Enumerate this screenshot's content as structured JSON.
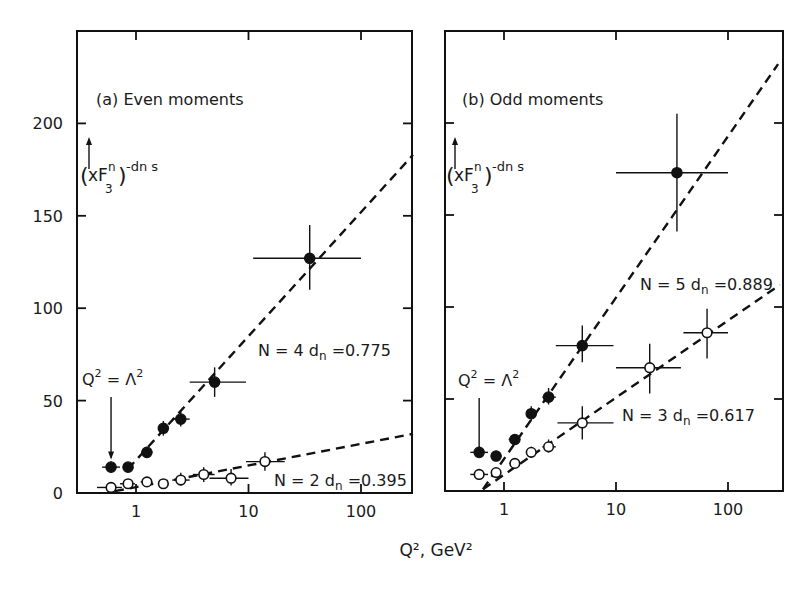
{
  "figure": {
    "xlabel": "Q², GeV²",
    "scale": {
      "x": "log",
      "y": "linear"
    }
  },
  "chart_data": [
    {
      "type": "scatter",
      "panel": "a",
      "title": "(a) Even moments",
      "ylabel": "(xF₃ⁿ)^(−dₙ s)",
      "ylabel_parts": {
        "open": "(",
        "base": "xF",
        "sub": "3",
        "sup": "n",
        "close": ")",
        "exp": "-dn s"
      },
      "xlabel": "Q², GeV²",
      "xscale": "log",
      "xlim": [
        0.3,
        290
      ],
      "ylim": [
        0,
        240
      ],
      "xticks": [
        1,
        10,
        100
      ],
      "xtick_labels": [
        "1",
        "10",
        "100"
      ],
      "yticks": [
        0,
        50,
        100,
        150,
        200
      ],
      "ytick_labels": [
        "0",
        "50",
        "100",
        "150",
        "200"
      ],
      "annotation": {
        "text_left": "Q",
        "sup1": "2",
        "eq": " = Λ",
        "sup2": "2",
        "arrow_x": 0.6
      },
      "series": [
        {
          "name": "N = 4",
          "label": "N = 4",
          "dn_label": "dn",
          "dn_value": "=0.775",
          "marker": "filled",
          "points": [
            {
              "x": 0.6,
              "y": 14,
              "xerr": [
                0.5,
                0.72
              ],
              "yerr": [
                11,
                17
              ]
            },
            {
              "x": 0.85,
              "y": 14,
              "xerr": [
                0.78,
                0.92
              ],
              "yerr": [
                12,
                16
              ]
            },
            {
              "x": 1.25,
              "y": 22,
              "xerr": [
                1.12,
                1.4
              ],
              "yerr": [
                19,
                25
              ]
            },
            {
              "x": 1.75,
              "y": 35,
              "xerr": [
                1.6,
                1.95
              ],
              "yerr": [
                31,
                39
              ]
            },
            {
              "x": 2.5,
              "y": 40,
              "xerr": [
                2.1,
                3.0
              ],
              "yerr": [
                36,
                44
              ]
            },
            {
              "x": 5,
              "y": 60,
              "xerr": [
                3.0,
                9.5
              ],
              "yerr": [
                52,
                68
              ]
            },
            {
              "x": 35,
              "y": 127,
              "xerr": [
                11,
                100
              ],
              "yerr": [
                110,
                145
              ]
            }
          ],
          "fit_line": {
            "from": [
              0.85,
              13
            ],
            "to": [
              290,
              183
            ]
          }
        },
        {
          "name": "N = 2",
          "label": "N = 2",
          "dn_label": "dn",
          "dn_value": "=0.395",
          "marker": "open",
          "points": [
            {
              "x": 0.6,
              "y": 3,
              "xerr": [
                0.45,
                0.75
              ],
              "yerr": [
                1,
                5
              ]
            },
            {
              "x": 0.85,
              "y": 5,
              "xerr": [
                0.72,
                0.98
              ],
              "yerr": [
                3,
                7
              ]
            },
            {
              "x": 1.25,
              "y": 6,
              "xerr": [
                1.1,
                1.4
              ],
              "yerr": [
                4,
                8
              ]
            },
            {
              "x": 1.75,
              "y": 5,
              "xerr": [
                1.6,
                1.95
              ],
              "yerr": [
                3,
                7
              ]
            },
            {
              "x": 2.5,
              "y": 7,
              "xerr": [
                2.1,
                3.0
              ],
              "yerr": [
                4,
                11
              ]
            },
            {
              "x": 4,
              "y": 10,
              "xerr": [
                3.2,
                5.0
              ],
              "yerr": [
                6,
                14
              ]
            },
            {
              "x": 7,
              "y": 8,
              "xerr": [
                4.5,
                10
              ],
              "yerr": [
                4,
                13
              ]
            },
            {
              "x": 14,
              "y": 17,
              "xerr": [
                9.5,
                21
              ],
              "yerr": [
                12,
                22
              ]
            }
          ],
          "fit_line": {
            "from": [
              0.65,
              1
            ],
            "to": [
              290,
              32
            ]
          }
        }
      ]
    },
    {
      "type": "scatter",
      "panel": "b",
      "title": "(b) Odd moments",
      "ylabel": "(xF₃ⁿ)^(−dₙ s)",
      "ylabel_parts": {
        "open": "(",
        "base": "xF",
        "sub": "3",
        "sup": "n",
        "close": ")",
        "exp": "-dn s"
      },
      "xlabel": "Q², GeV²",
      "xscale": "log",
      "xlim": [
        0.3,
        290
      ],
      "ylim": [
        0,
        240
      ],
      "xticks": [
        1,
        10,
        100
      ],
      "xtick_labels": [
        "1",
        "10",
        "100"
      ],
      "yticks": [
        0,
        50,
        100,
        150,
        200
      ],
      "ytick_labels": [
        "0",
        "50",
        "100",
        "150",
        "200"
      ],
      "annotation": {
        "text_left": "Q",
        "sup1": "2",
        "eq": " = Λ",
        "sup2": "2",
        "arrow_x": 0.6
      },
      "series": [
        {
          "name": "N = 5",
          "label": "N = 5",
          "dn_label": "dn",
          "dn_value": "=0.889",
          "marker": "filled",
          "points": [
            {
              "x": 0.6,
              "y": 21,
              "xerr": [
                0.5,
                0.72
              ],
              "yerr": [
                18,
                24
              ]
            },
            {
              "x": 0.85,
              "y": 19,
              "xerr": [
                0.78,
                0.93
              ],
              "yerr": [
                17,
                21
              ]
            },
            {
              "x": 1.25,
              "y": 28,
              "xerr": [
                1.1,
                1.4
              ],
              "yerr": [
                25,
                31
              ]
            },
            {
              "x": 1.75,
              "y": 42,
              "xerr": [
                1.6,
                1.95
              ],
              "yerr": [
                38,
                46
              ]
            },
            {
              "x": 2.5,
              "y": 51,
              "xerr": [
                2.2,
                2.9
              ],
              "yerr": [
                47,
                56
              ]
            },
            {
              "x": 5,
              "y": 79,
              "xerr": [
                2.9,
                9.5
              ],
              "yerr": [
                70,
                90
              ]
            },
            {
              "x": 35,
              "y": 173,
              "xerr": [
                10,
                100
              ],
              "yerr": [
                141,
                205
              ]
            }
          ],
          "fit_line": {
            "from": [
              0.65,
              1
            ],
            "to": [
              280,
              232
            ]
          }
        },
        {
          "name": "N = 3",
          "label": "N = 3",
          "dn_label": "dn",
          "dn_value": "=0.617",
          "marker": "open",
          "points": [
            {
              "x": 0.6,
              "y": 9,
              "xerr": [
                0.5,
                0.72
              ],
              "yerr": [
                6,
                12
              ]
            },
            {
              "x": 0.85,
              "y": 10,
              "xerr": [
                0.78,
                0.93
              ],
              "yerr": [
                8,
                12
              ]
            },
            {
              "x": 1.25,
              "y": 15,
              "xerr": [
                1.12,
                1.4
              ],
              "yerr": [
                13,
                17
              ]
            },
            {
              "x": 1.75,
              "y": 21,
              "xerr": [
                1.6,
                1.95
              ],
              "yerr": [
                18,
                24
              ]
            },
            {
              "x": 2.5,
              "y": 24,
              "xerr": [
                2.2,
                2.9
              ],
              "yerr": [
                21,
                28
              ]
            },
            {
              "x": 5,
              "y": 37,
              "xerr": [
                3.0,
                9.5
              ],
              "yerr": [
                28,
                46
              ]
            },
            {
              "x": 20,
              "y": 67,
              "xerr": [
                10,
                38
              ],
              "yerr": [
                53,
                80
              ]
            },
            {
              "x": 65,
              "y": 86,
              "xerr": [
                40,
                100
              ],
              "yerr": [
                72,
                99
              ]
            }
          ],
          "fit_line": {
            "from": [
              0.65,
              1
            ],
            "to": [
              290,
              112
            ]
          }
        }
      ]
    }
  ]
}
